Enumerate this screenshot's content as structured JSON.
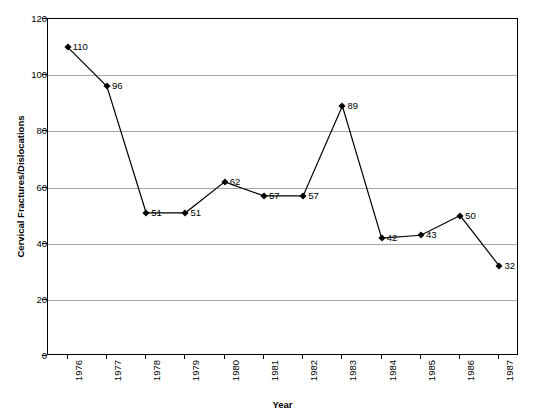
{
  "chart_data": {
    "type": "line",
    "title": "",
    "xlabel": "Year",
    "ylabel": "Cervical Fractures/Dislocations",
    "categories": [
      "1976",
      "1977",
      "1978",
      "1979",
      "1980",
      "1981",
      "1982",
      "1983",
      "1984",
      "1985",
      "1986",
      "1987"
    ],
    "values": [
      110,
      96,
      51,
      51,
      62,
      57,
      57,
      89,
      42,
      43,
      50,
      32
    ],
    "point_labels": [
      "110",
      "96",
      "51",
      "51",
      "62",
      "57",
      "57",
      "89",
      "42",
      "43",
      "50",
      "32"
    ],
    "ylim": [
      0,
      120
    ],
    "y_ticks": [
      0,
      20,
      40,
      60,
      80,
      100,
      120
    ],
    "y_tick_labels": [
      "0",
      "20",
      "40",
      "60",
      "80",
      "100",
      "120"
    ],
    "grid": "horizontal",
    "legend": "none",
    "series_color": "#000000",
    "gridline_color": "#a6a6a6",
    "axis_color": "#000000",
    "background_color": "#ffffff",
    "marker": "diamond",
    "series": [
      {
        "name": "Cervical Fractures/Dislocations",
        "values": [
          110,
          96,
          51,
          51,
          62,
          57,
          57,
          89,
          42,
          43,
          50,
          32
        ]
      }
    ]
  }
}
